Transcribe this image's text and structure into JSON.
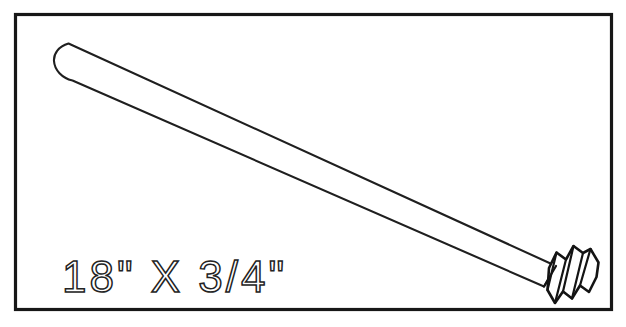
{
  "drawing": {
    "title": "Threaded Dowel Rod",
    "subject": "dowel-rod",
    "frame": {
      "name": "border-frame",
      "x": 14,
      "y": 13,
      "width": 598,
      "height": 297,
      "stroke_color": "#171717",
      "stroke_width": 3.2,
      "fill_color": "#ffffff"
    },
    "background_color": "#ffffff",
    "line_color": "#1c1c1c"
  },
  "label": {
    "dimension_text": "18\" X 3/4\"",
    "length_value": "18",
    "length_unit": "\"",
    "separator": "X",
    "diameter_value": "3/4",
    "diameter_unit": "\"",
    "x": 62,
    "y": 292,
    "font_size": 44,
    "color": "#232323"
  },
  "rod": {
    "name": "dowel-shaft",
    "cap_end": "rounded",
    "tip_end": "threaded",
    "start_point": [
      62,
      60
    ],
    "end_point": [
      538,
      272
    ],
    "diameter_px": 27,
    "stroke_color": "#1f1f1f",
    "stroke_width": 2.1
  },
  "threads": {
    "name": "screw-threads",
    "turn_count": 4,
    "start_x": 535,
    "end_x": 600,
    "stroke_color": "#141414",
    "stroke_width": 2.6
  },
  "colors": {
    "ink": "#1c1c1c",
    "frame": "#171717",
    "paper": "#ffffff",
    "text": "#232323"
  }
}
